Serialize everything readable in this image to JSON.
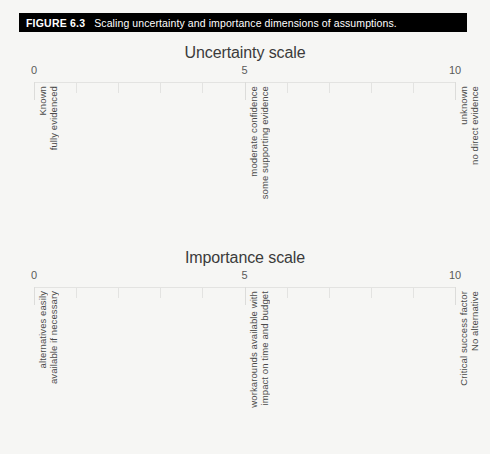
{
  "figure": {
    "number_label": "FIGURE 6.3",
    "caption": "Scaling uncertainty and importance dimensions of assumptions."
  },
  "colors": {
    "background": "#f6f6f4",
    "caption_bar": "#000000",
    "caption_text": "#ffffff",
    "axis_line": "#e3e3e1",
    "title_text": "#3b3b3b",
    "label_text": "#4a4a4a",
    "tick_number_text": "#5a5a5a"
  },
  "chart_data": [
    {
      "type": "scale",
      "id": "uncertainty",
      "title": "Uncertainty scale",
      "xlabel": "",
      "ylabel": "",
      "xlim": [
        0,
        10
      ],
      "ticks": [
        0,
        1,
        2,
        3,
        4,
        5,
        6,
        7,
        8,
        9,
        10
      ],
      "tick_labels": [
        "0",
        "",
        "",
        "",
        "",
        "5",
        "",
        "",
        "",
        "",
        "10"
      ],
      "major_ticks": [
        0,
        5,
        10
      ],
      "grid": false,
      "legend": "none",
      "annotations": [
        {
          "at": 0,
          "lines": [
            "Known",
            "fully evidenced"
          ]
        },
        {
          "at": 5,
          "lines": [
            "moderate confidence",
            "some supporting evidence"
          ]
        },
        {
          "at": 10,
          "lines": [
            "unknown",
            "no direct evidence"
          ]
        }
      ]
    },
    {
      "type": "scale",
      "id": "importance",
      "title": "Importance scale",
      "xlabel": "",
      "ylabel": "",
      "xlim": [
        0,
        10
      ],
      "ticks": [
        0,
        1,
        2,
        3,
        4,
        5,
        6,
        7,
        8,
        9,
        10
      ],
      "tick_labels": [
        "0",
        "",
        "",
        "",
        "",
        "5",
        "",
        "",
        "",
        "",
        "10"
      ],
      "major_ticks": [
        0,
        5,
        10
      ],
      "grid": false,
      "legend": "none",
      "annotations": [
        {
          "at": 0,
          "lines": [
            "alternatives easily",
            "available if necessary"
          ]
        },
        {
          "at": 5,
          "lines": [
            "workarounds available with",
            "impact on time and budget"
          ]
        },
        {
          "at": 10,
          "lines": [
            "Critical success factor",
            "No alternative"
          ]
        }
      ]
    }
  ]
}
